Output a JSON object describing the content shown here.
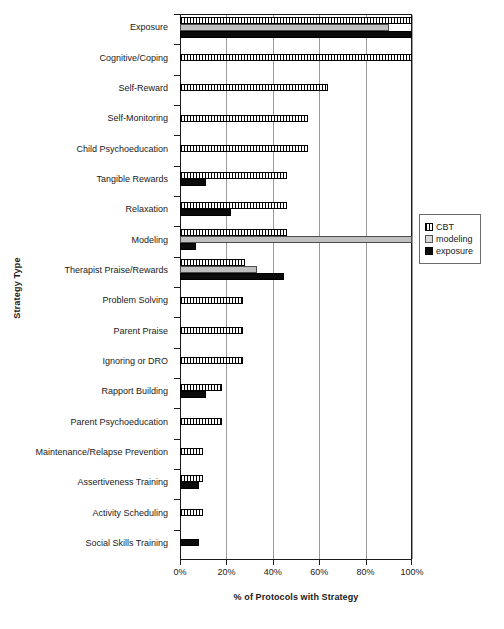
{
  "chart_data": {
    "type": "bar",
    "orientation": "horizontal",
    "title": "",
    "xlabel": "% of Protocols with Strategy",
    "ylabel": "Strategy Type",
    "xlim": [
      0,
      100
    ],
    "xticks": [
      "0%",
      "20%",
      "40%",
      "60%",
      "80%",
      "100%"
    ],
    "xtick_values": [
      0,
      20,
      40,
      60,
      80,
      100
    ],
    "grid": "vertical",
    "legend_position": "right",
    "categories": [
      "Exposure",
      "Cognitive/Coping",
      "Self-Reward",
      "Self-Monitoring",
      "Child Psychoeducation",
      "Tangible Rewards",
      "Relaxation",
      "Modeling",
      "Therapist Praise/Rewards",
      "Problem Solving",
      "Parent Praise",
      "Ignoring or DRO",
      "Rapport Building",
      "Parent Psychoeducation",
      "Maintenance/Relapse Prevention",
      "Assertiveness Training",
      "Activity Scheduling",
      "Social Skills Training"
    ],
    "series": [
      {
        "name": "CBT",
        "color": "#ffffff",
        "pattern": "vertical-hatch",
        "values": [
          100,
          100,
          64,
          55,
          55,
          46,
          46,
          46,
          28,
          27,
          27,
          27,
          18,
          18,
          10,
          10,
          10,
          0
        ]
      },
      {
        "name": "modeling",
        "color": "#bfbfbf",
        "pattern": "solid-light",
        "values": [
          90,
          0,
          0,
          0,
          0,
          0,
          0,
          100,
          33,
          0,
          0,
          0,
          0,
          0,
          0,
          0,
          0,
          0
        ]
      },
      {
        "name": "exposure",
        "color": "#0b0b0b",
        "pattern": "solid-dark",
        "values": [
          100,
          0,
          0,
          0,
          0,
          11,
          22,
          7,
          45,
          0,
          0,
          0,
          11,
          0,
          0,
          8,
          0,
          8
        ]
      }
    ]
  },
  "legend": {
    "items": [
      {
        "label": "CBT"
      },
      {
        "label": "modeling"
      },
      {
        "label": "exposure"
      }
    ]
  }
}
